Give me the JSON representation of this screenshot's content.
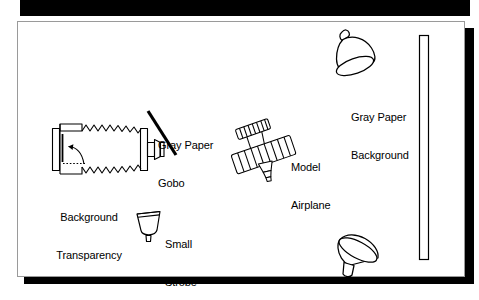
{
  "figure": {
    "kind": "photography-lighting-setup-diagram",
    "panel": {
      "background_color": "#ffffff",
      "border_color": "#9a9a9a",
      "shadow_color": "#000000"
    },
    "top_bar": {
      "name": "top-black-bar",
      "color": "#000000"
    },
    "ink_color": "#000000"
  },
  "labels": [
    {
      "id": "background-transparency",
      "lines": [
        "Background",
        "Transparency"
      ],
      "text": "Background\nTransparency",
      "x": 38,
      "y": 186,
      "align": "center"
    },
    {
      "id": "gray-paper-gobo",
      "lines": [
        "Gray Paper",
        "Gobo"
      ],
      "text": "Gray Paper\nGobo",
      "x": 158,
      "y": 114,
      "align": "left"
    },
    {
      "id": "model-airplane",
      "lines": [
        "Model",
        "Airplane"
      ],
      "text": "Model\nAirplane",
      "x": 291,
      "y": 136,
      "align": "left"
    },
    {
      "id": "small-strobe",
      "lines": [
        "Small",
        "Strobe"
      ],
      "text": "Small\nStrobe",
      "x": 165,
      "y": 213,
      "align": "left"
    },
    {
      "id": "gray-paper-background",
      "lines": [
        "Gray Paper",
        "Background"
      ],
      "text": "Gray Paper\nBackground",
      "x": 351,
      "y": 86,
      "align": "left"
    }
  ],
  "objects": [
    {
      "id": "background-transparency-unit",
      "name": "enlarger-with-bellows",
      "description": "Film holder with slide, curved arrow and dotted optical axis, zigzag bellows tapering to a lens mount"
    },
    {
      "id": "gobo-panel",
      "name": "gray-paper-gobo",
      "description": "Thick diagonal black bar acting as a flag"
    },
    {
      "id": "airplane",
      "name": "model-airplane",
      "description": "Ribbed fuselage tube with ribbed upper wing and nose cone, tilted"
    },
    {
      "id": "small-strobe-head",
      "name": "small-strobe",
      "description": "Small bowl-shaped reflector on a short stem"
    },
    {
      "id": "strobe-top-right",
      "name": "strobe-head-upper",
      "description": "Cone reflector aimed down-left with neck at top"
    },
    {
      "id": "strobe-bottom-right",
      "name": "strobe-head-lower",
      "description": "Cone reflector aimed up-right with stem at lower left"
    },
    {
      "id": "backdrop-bar",
      "name": "gray-paper-background-sweep",
      "description": "Tall narrow vertical rectangle at right edge"
    }
  ]
}
